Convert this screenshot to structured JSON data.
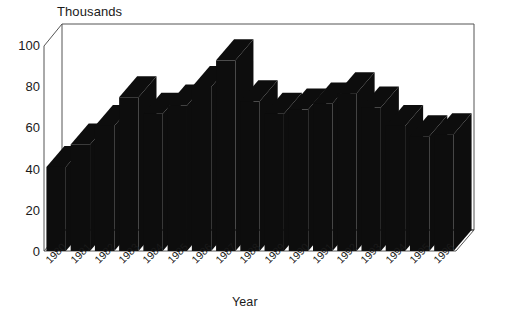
{
  "chart_data": {
    "type": "bar",
    "title": "",
    "ylabel": "Thousands",
    "xlabel": "Year",
    "categories": [
      "1980",
      "1981",
      "1982",
      "1983",
      "1984",
      "1985",
      "1986",
      "1987",
      "1988",
      "1989",
      "1990",
      "1991",
      "1992",
      "1993",
      "1994",
      "1995",
      "1996"
    ],
    "values": [
      41,
      52,
      61,
      75,
      67,
      71,
      80,
      93,
      73,
      67,
      69,
      72,
      77,
      70,
      61,
      56,
      57
    ],
    "ylim": [
      0,
      100
    ],
    "yticks": [
      0,
      20,
      40,
      60,
      80,
      100
    ],
    "ytick_labels": [
      "0",
      "20",
      "40",
      "60",
      "80",
      "100"
    ],
    "grid": false,
    "legend": null,
    "series": [
      {
        "name": "Thousands",
        "values": [
          41,
          52,
          61,
          75,
          67,
          71,
          80,
          93,
          73,
          67,
          69,
          72,
          77,
          70,
          61,
          56,
          57
        ]
      }
    ],
    "style": {
      "bar_color": "#0d0d0d",
      "background": "#ffffff",
      "axis_color": "#4a4a4a",
      "text_color": "#1a1a1a",
      "three_d": true,
      "x_label_rotation": -45
    }
  }
}
